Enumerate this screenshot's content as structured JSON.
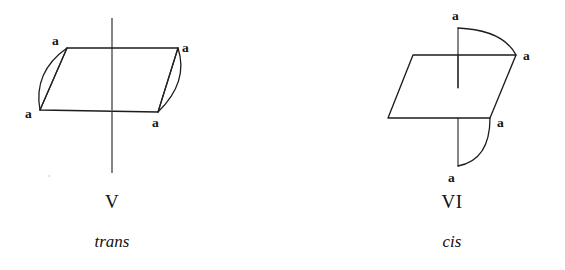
{
  "page": {
    "background_color": "#ffffff",
    "ink_color": "#1c1c1c",
    "width": 565,
    "height": 270
  },
  "figures": [
    {
      "id": "figure-v",
      "roman_numeral": "V",
      "descriptor": "trans",
      "substituent_labels": [
        "a",
        "a",
        "a",
        "a"
      ],
      "label_positions": [
        {
          "text": "a",
          "x": 52,
          "y": 45,
          "corner": "top-left"
        },
        {
          "text": "a",
          "x": 182,
          "y": 52,
          "corner": "top-right"
        },
        {
          "text": "a",
          "x": 25,
          "y": 118,
          "corner": "bottom-left"
        },
        {
          "text": "a",
          "x": 152,
          "y": 127,
          "corner": "bottom-right"
        }
      ],
      "ring_plane": {
        "shape": "parallelogram",
        "vertices": [
          {
            "x": 67,
            "y": 48
          },
          {
            "x": 178,
            "y": 48
          },
          {
            "x": 158,
            "y": 112
          },
          {
            "x": 40,
            "y": 110
          }
        ]
      },
      "symmetry_axis": {
        "type": "vertical-line",
        "x": 112,
        "y_top": 18,
        "y_bottom": 173,
        "gap_top": 80,
        "gap_bottom": 110
      },
      "bonds": [
        {
          "type": "arc",
          "side": "left",
          "from": {
            "x": 67,
            "y": 48
          },
          "to": {
            "x": 40,
            "y": 110
          },
          "bulge": "outward"
        },
        {
          "type": "line",
          "side": "left",
          "from": {
            "x": 67,
            "y": 48
          },
          "to": {
            "x": 40,
            "y": 110
          }
        },
        {
          "type": "arc",
          "side": "right",
          "from": {
            "x": 178,
            "y": 48
          },
          "to": {
            "x": 158,
            "y": 112
          },
          "bulge": "outward"
        },
        {
          "type": "line",
          "side": "right",
          "from": {
            "x": 178,
            "y": 48
          },
          "to": {
            "x": 158,
            "y": 112
          }
        }
      ]
    },
    {
      "id": "figure-vi",
      "roman_numeral": "VI",
      "descriptor": "cis",
      "substituent_labels": [
        "a",
        "a",
        "a",
        "a"
      ],
      "label_positions": [
        {
          "text": "a",
          "x": 455,
          "y": 18,
          "corner": "top-stub"
        },
        {
          "text": "a",
          "x": 527,
          "y": 59,
          "corner": "right-upper"
        },
        {
          "text": "a",
          "x": 504,
          "y": 127,
          "corner": "right-lower"
        },
        {
          "text": "a",
          "x": 450,
          "y": 180,
          "corner": "bottom-stub"
        }
      ],
      "ring_plane": {
        "shape": "parallelogram",
        "vertices": [
          {
            "x": 413,
            "y": 55
          },
          {
            "x": 516,
            "y": 55
          },
          {
            "x": 490,
            "y": 118
          },
          {
            "x": 388,
            "y": 118
          }
        ]
      },
      "symmetry_axis": {
        "type": "vertical-line",
        "x": 458,
        "y_top": 55,
        "y_bottom": 88
      },
      "bonds": [
        {
          "type": "line",
          "side": "top",
          "from": {
            "x": 458,
            "y": 28
          },
          "to": {
            "x": 458,
            "y": 88
          }
        },
        {
          "type": "arc",
          "side": "top",
          "from": {
            "x": 458,
            "y": 28
          },
          "to": {
            "x": 516,
            "y": 55
          },
          "bulge": "outward"
        },
        {
          "type": "line",
          "side": "bottom",
          "from": {
            "x": 458,
            "y": 118
          },
          "to": {
            "x": 458,
            "y": 166
          }
        },
        {
          "type": "arc",
          "side": "bottom",
          "from": {
            "x": 458,
            "y": 166
          },
          "to": {
            "x": 490,
            "y": 118
          },
          "bulge": "outward"
        }
      ]
    }
  ]
}
